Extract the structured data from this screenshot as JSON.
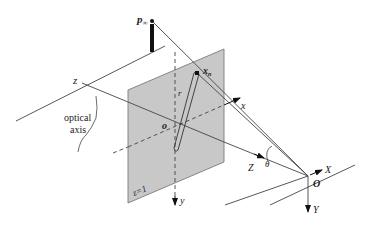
{
  "diagram": {
    "type": "camera-projection-geometry",
    "labels": {
      "p_inf": "p",
      "p_inf_sub": "∞",
      "z_axis": "z",
      "optical_axis_line1": "optical",
      "optical_axis_line2": "axis",
      "x_n": "x",
      "x_n_sub": "n",
      "r": "r",
      "o_small": "o",
      "x_small": "x",
      "y_small": "y",
      "plane_eq": "z=1",
      "theta": "θ",
      "Z_world": "Z",
      "X_world": "X",
      "Y_world": "Y",
      "O_world": "O"
    },
    "colors": {
      "plane_fill": "#c8c8c8",
      "plane_edge": "#7a7a7a",
      "line": "#444444",
      "dark": "#111111"
    }
  }
}
